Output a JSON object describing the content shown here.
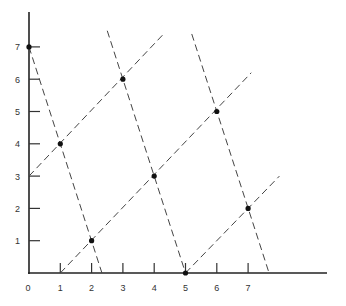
{
  "chart_data": {
    "type": "line",
    "title": "",
    "xlabel": "",
    "ylabel": "",
    "xlim": [
      0,
      9.3
    ],
    "ylim": [
      0,
      8
    ],
    "grid": false,
    "x_ticks": [
      "0",
      "1",
      "2",
      "3",
      "4",
      "5",
      "6",
      "7"
    ],
    "y_ticks": [
      "1",
      "2",
      "3",
      "4",
      "5",
      "6",
      "7"
    ],
    "points": [
      {
        "x": 0,
        "y": 7
      },
      {
        "x": 1,
        "y": 4
      },
      {
        "x": 2,
        "y": 1
      },
      {
        "x": 3,
        "y": 6
      },
      {
        "x": 4,
        "y": 3
      },
      {
        "x": 5,
        "y": 0
      },
      {
        "x": 6,
        "y": 5
      },
      {
        "x": 7,
        "y": 2
      }
    ],
    "series": [
      {
        "name": "steep-line-1",
        "style": "dashed",
        "x": [
          0,
          2.33
        ],
        "y": [
          7,
          0
        ]
      },
      {
        "name": "steep-line-2",
        "style": "dashed",
        "x": [
          2.5,
          5
        ],
        "y": [
          7.5,
          0
        ]
      },
      {
        "name": "steep-line-3",
        "style": "dashed",
        "x": [
          5.2,
          7.67
        ],
        "y": [
          7.4,
          0
        ]
      },
      {
        "name": "diagonal-line-1",
        "style": "dashed",
        "x": [
          0,
          4.3
        ],
        "y": [
          3,
          7.4
        ]
      },
      {
        "name": "diagonal-line-2",
        "style": "dashed",
        "x": [
          1,
          7.1
        ],
        "y": [
          0,
          6.2
        ]
      },
      {
        "name": "diagonal-line-3",
        "style": "dashed",
        "x": [
          5,
          8
        ],
        "y": [
          0,
          3
        ]
      }
    ]
  }
}
